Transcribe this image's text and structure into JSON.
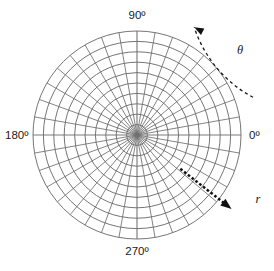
{
  "figure": {
    "background_color": "#ffffff",
    "grid_color": "#6e6e6e",
    "label_color": "#1a1a1a",
    "arrow_color": "#111111"
  },
  "axis_labels": {
    "top": "90º",
    "left": "180º",
    "right": "0º",
    "bottom": "270º"
  },
  "annotations": {
    "theta": "θ",
    "radius": "r"
  },
  "chart_data": {
    "type": "polar-grid",
    "center": {
      "x": 137,
      "y": 135
    },
    "outer_radius": 104,
    "num_circles": 10,
    "num_spokes": 36,
    "spoke_step_degrees": 10,
    "circle_radii": [
      10.4,
      20.8,
      31.2,
      41.6,
      52,
      62.4,
      72.8,
      83.2,
      93.6,
      104
    ],
    "angle_ticks": [
      0,
      90,
      180,
      270
    ],
    "angle_tick_labels": [
      "0º",
      "90º",
      "180º",
      "270º"
    ],
    "theta_arc": {
      "label": "θ",
      "direction": "counterclockwise",
      "start_angle_deg": 18,
      "end_angle_deg": 62,
      "radius": 122,
      "style": "dashed",
      "arrow_at": "end"
    },
    "radius_arrow": {
      "label": "r",
      "from_radius": 55,
      "to_radius": 120,
      "angle_deg": -38,
      "style": "dotted-thick",
      "arrow_at": "end"
    },
    "grid": true,
    "legend": "none"
  }
}
